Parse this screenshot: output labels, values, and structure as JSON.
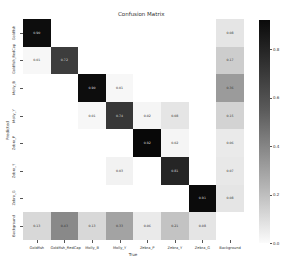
{
  "chart_data": {
    "type": "heatmap",
    "xlabel": "True",
    "ylabel": "Predicted",
    "x_labels": [
      "Goldfish",
      "Goldfish_RedCap",
      "Molly_B",
      "Molly_Y",
      "Zebra_P",
      "Zebra_Y",
      "Zebra_G",
      "Background"
    ],
    "y_labels": [
      "Goldfish",
      "Goldfish_RedCap",
      "Molly_B",
      "Molly_Y",
      "Zebra_P",
      "Zebra_Y",
      "Zebra_G",
      "Background"
    ],
    "values": [
      [
        0.9,
        null,
        null,
        null,
        null,
        null,
        null,
        0.08
      ],
      [
        0.01,
        0.72,
        null,
        null,
        null,
        null,
        null,
        0.17
      ],
      [
        null,
        null,
        0.9,
        0.01,
        null,
        null,
        null,
        0.36
      ],
      [
        null,
        null,
        0.01,
        0.74,
        0.02,
        0.08,
        null,
        0.15
      ],
      [
        null,
        null,
        null,
        null,
        0.92,
        0.02,
        null,
        0.06
      ],
      [
        null,
        null,
        null,
        0.03,
        null,
        0.81,
        null,
        0.07
      ],
      [
        null,
        null,
        null,
        null,
        null,
        null,
        0.91,
        0.08
      ],
      [
        0.13,
        0.43,
        0.13,
        0.33,
        0.06,
        0.21,
        0.08,
        null
      ]
    ],
    "colorbar": {
      "min": 0.0,
      "max": 0.92,
      "ticks": [
        "0.0",
        "0.2",
        "0.4",
        "0.6",
        "0.8"
      ]
    },
    "colormap": "Greys",
    "grid": false
  }
}
